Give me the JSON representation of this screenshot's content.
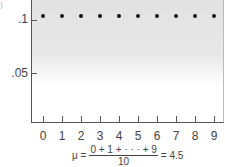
{
  "chart_data": {
    "type": "scatter",
    "title": "",
    "xlabel": "",
    "ylabel": "",
    "x": [
      0,
      1,
      2,
      3,
      4,
      5,
      6,
      7,
      8,
      9
    ],
    "values": [
      0.1,
      0.1,
      0.1,
      0.1,
      0.1,
      0.1,
      0.1,
      0.1,
      0.1,
      0.1
    ],
    "x_tick_labels": [
      "0",
      "1",
      "2",
      "3",
      "4",
      "5",
      "6",
      "7",
      "8",
      "9"
    ],
    "y_tick_labels": [
      ".1",
      ".05"
    ],
    "y_ticks": [
      0.1,
      0.05
    ],
    "ylim": [
      0,
      0.115
    ],
    "grid": false,
    "annotation": "μ = (0 + 1 + ··· + 9) / 10 = 4.5"
  },
  "corner_mark": ")",
  "formula": {
    "lhs": "μ =",
    "numerator": "0 + 1 + · · · + 9",
    "denominator": "10",
    "rhs": "= 4.5"
  },
  "colors": {
    "dot": "#111111",
    "axis": "#555555",
    "shade": "#e2e2e2"
  }
}
